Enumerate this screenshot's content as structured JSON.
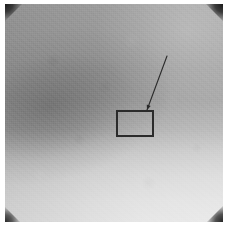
{
  "figure": {
    "kind": "grayscale-micrograph",
    "width_px": 228,
    "height_px": 226,
    "caption": "",
    "title": "",
    "border": {
      "margin_px": 4,
      "margin_color": "#ffffff"
    },
    "image_area": {
      "left_px": 5,
      "top_px": 4,
      "width_px": 218,
      "height_px": 218,
      "base_gray_hex": "#9a9a9a",
      "light_gray_hex": "#dcdcdc",
      "dark_band_gray_hex": "#8a8a8a",
      "gradient_description": "mid-gray at top with a darker diagonal band across the mid-left, brightening smoothly toward the bottom and upper right"
    },
    "corner_marks": {
      "count": 4,
      "color_hex": "#1a1a1a",
      "shape": "triangle",
      "names": [
        "top-left",
        "top-right",
        "bottom-left",
        "bottom-right"
      ]
    }
  },
  "annotations": {
    "roi_box": {
      "label": "",
      "stroke_hex": "#2b2b2b",
      "stroke_width_px": 1.4,
      "fill": "none",
      "x_px": 117,
      "y_px": 111,
      "width_px": 36,
      "height_px": 25
    },
    "leader_arrow": {
      "label": "",
      "stroke_hex": "#2b2b2b",
      "stroke_width_px": 1.1,
      "tail_x_px": 167,
      "tail_y_px": 56,
      "head_x_px": 147,
      "head_y_px": 110,
      "head_size_px": 5
    }
  }
}
